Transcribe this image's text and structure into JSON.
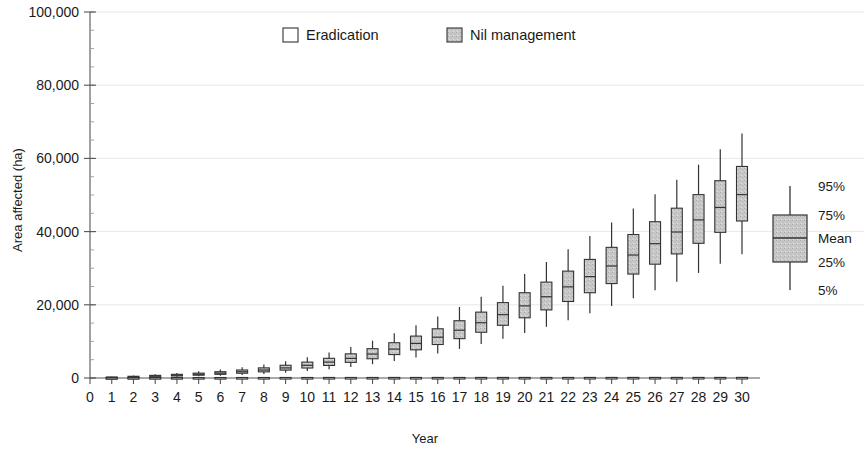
{
  "chart_data": {
    "type": "box",
    "title": "",
    "xlabel": "Year",
    "ylabel": "Area affected (ha)",
    "xlim": [
      0,
      30
    ],
    "ylim": [
      0,
      100000
    ],
    "ytick_labels": [
      "0",
      "20,000",
      "40,000",
      "60,000",
      "80,000",
      "100,000"
    ],
    "ytick_values": [
      0,
      20000,
      40000,
      60000,
      80000,
      100000
    ],
    "y_minor_step": 5000,
    "xtick_labels": [
      "0",
      "1",
      "2",
      "3",
      "4",
      "5",
      "6",
      "7",
      "8",
      "9",
      "10",
      "11",
      "12",
      "13",
      "14",
      "15",
      "16",
      "17",
      "18",
      "19",
      "20",
      "21",
      "22",
      "23",
      "24",
      "25",
      "26",
      "27",
      "28",
      "29",
      "30"
    ],
    "grid": "horizontal-major-faint",
    "legend_position": "top-center",
    "legend": [
      {
        "label": "Eradication",
        "fill": "#ffffff",
        "stroke": "#333333"
      },
      {
        "label": "Nil management",
        "fill": "#b9b9b9",
        "stroke": "#333333"
      }
    ],
    "key": {
      "labels": [
        "95%",
        "75%",
        "Mean",
        "25%",
        "5%"
      ],
      "box_fill": "#c6c6c6",
      "box_stroke": "#333333"
    },
    "series": [
      {
        "name": "Nil management",
        "fill": "#c6c6c6",
        "stroke": "#333333",
        "boxes": [
          {
            "year": 1,
            "p5": 60,
            "p25": 120,
            "mean": 180,
            "p75": 250,
            "p95": 360
          },
          {
            "year": 2,
            "p5": 130,
            "p25": 250,
            "mean": 350,
            "p75": 470,
            "p95": 680
          },
          {
            "year": 3,
            "p5": 220,
            "p25": 390,
            "mean": 540,
            "p75": 720,
            "p95": 1020
          },
          {
            "year": 4,
            "p5": 330,
            "p25": 560,
            "mean": 760,
            "p75": 1000,
            "p95": 1400
          },
          {
            "year": 5,
            "p5": 470,
            "p25": 760,
            "mean": 1020,
            "p75": 1330,
            "p95": 1840
          },
          {
            "year": 6,
            "p5": 640,
            "p25": 1000,
            "mean": 1330,
            "p75": 1720,
            "p95": 2350
          },
          {
            "year": 7,
            "p5": 850,
            "p25": 1300,
            "mean": 1710,
            "p75": 2190,
            "p95": 2960
          },
          {
            "year": 8,
            "p5": 1120,
            "p25": 1680,
            "mean": 2180,
            "p75": 2770,
            "p95": 3700
          },
          {
            "year": 9,
            "p5": 1460,
            "p25": 2150,
            "mean": 2760,
            "p75": 3480,
            "p95": 4610
          },
          {
            "year": 10,
            "p5": 1880,
            "p25": 2730,
            "mean": 3470,
            "p75": 4340,
            "p95": 5700
          },
          {
            "year": 11,
            "p5": 2400,
            "p25": 3430,
            "mean": 4330,
            "p75": 5380,
            "p95": 7000
          },
          {
            "year": 12,
            "p5": 3020,
            "p25": 4270,
            "mean": 5350,
            "p75": 6600,
            "p95": 8500
          },
          {
            "year": 13,
            "p5": 3760,
            "p25": 5260,
            "mean": 6540,
            "p75": 8020,
            "p95": 10200
          },
          {
            "year": 14,
            "p5": 4620,
            "p25": 6400,
            "mean": 7900,
            "p75": 9640,
            "p95": 12200
          },
          {
            "year": 15,
            "p5": 5600,
            "p25": 7700,
            "mean": 9450,
            "p75": 11450,
            "p95": 14400
          },
          {
            "year": 16,
            "p5": 6700,
            "p25": 9150,
            "mean": 11150,
            "p75": 13450,
            "p95": 16800
          },
          {
            "year": 17,
            "p5": 7950,
            "p25": 10750,
            "mean": 13050,
            "p75": 15650,
            "p95": 19400
          },
          {
            "year": 18,
            "p5": 9300,
            "p25": 12500,
            "mean": 15100,
            "p75": 18000,
            "p95": 22200
          },
          {
            "year": 19,
            "p5": 10750,
            "p25": 14400,
            "mean": 17300,
            "p75": 20600,
            "p95": 25200
          },
          {
            "year": 20,
            "p5": 12300,
            "p25": 16450,
            "mean": 19700,
            "p75": 23300,
            "p95": 28400
          },
          {
            "year": 21,
            "p5": 14000,
            "p25": 18600,
            "mean": 22200,
            "p75": 26200,
            "p95": 31700
          },
          {
            "year": 22,
            "p5": 15800,
            "p25": 20900,
            "mean": 24900,
            "p75": 29200,
            "p95": 35200
          },
          {
            "year": 23,
            "p5": 17700,
            "p25": 23300,
            "mean": 27700,
            "p75": 32400,
            "p95": 38800
          },
          {
            "year": 24,
            "p5": 19700,
            "p25": 25800,
            "mean": 30600,
            "p75": 35700,
            "p95": 42500
          },
          {
            "year": 25,
            "p5": 21800,
            "p25": 28400,
            "mean": 33600,
            "p75": 39200,
            "p95": 46300
          },
          {
            "year": 26,
            "p5": 24000,
            "p25": 31100,
            "mean": 36700,
            "p75": 42700,
            "p95": 50200
          },
          {
            "year": 27,
            "p5": 26300,
            "p25": 33900,
            "mean": 39900,
            "p75": 46400,
            "p95": 54200
          },
          {
            "year": 28,
            "p5": 28700,
            "p25": 36800,
            "mean": 43200,
            "p75": 50100,
            "p95": 58300
          },
          {
            "year": 29,
            "p5": 31200,
            "p25": 39800,
            "mean": 46600,
            "p75": 53900,
            "p95": 62500
          },
          {
            "year": 30,
            "p5": 33800,
            "p25": 42900,
            "mean": 50100,
            "p75": 57800,
            "p95": 66800
          }
        ]
      },
      {
        "name": "Eradication",
        "fill": "#ffffff",
        "stroke": "#333333",
        "boxes": [
          {
            "year": 1,
            "p5": 0,
            "p25": 30,
            "mean": 60,
            "p75": 95,
            "p95": 170
          },
          {
            "year": 2,
            "p5": 0,
            "p25": 35,
            "mean": 70,
            "p75": 110,
            "p95": 200
          },
          {
            "year": 3,
            "p5": 0,
            "p25": 40,
            "mean": 75,
            "p75": 120,
            "p95": 215
          },
          {
            "year": 4,
            "p5": 0,
            "p25": 40,
            "mean": 80,
            "p75": 125,
            "p95": 225
          },
          {
            "year": 5,
            "p5": 0,
            "p25": 45,
            "mean": 85,
            "p75": 130,
            "p95": 235
          },
          {
            "year": 6,
            "p5": 0,
            "p25": 45,
            "mean": 85,
            "p75": 135,
            "p95": 240
          },
          {
            "year": 7,
            "p5": 0,
            "p25": 50,
            "mean": 90,
            "p75": 140,
            "p95": 245
          },
          {
            "year": 8,
            "p5": 0,
            "p25": 50,
            "mean": 90,
            "p75": 140,
            "p95": 250
          },
          {
            "year": 9,
            "p5": 0,
            "p25": 50,
            "mean": 95,
            "p75": 145,
            "p95": 255
          },
          {
            "year": 10,
            "p5": 0,
            "p25": 55,
            "mean": 95,
            "p75": 145,
            "p95": 255
          },
          {
            "year": 11,
            "p5": 0,
            "p25": 55,
            "mean": 95,
            "p75": 150,
            "p95": 260
          },
          {
            "year": 12,
            "p5": 0,
            "p25": 55,
            "mean": 100,
            "p75": 150,
            "p95": 260
          },
          {
            "year": 13,
            "p5": 0,
            "p25": 55,
            "mean": 100,
            "p75": 150,
            "p95": 265
          },
          {
            "year": 14,
            "p5": 0,
            "p25": 55,
            "mean": 100,
            "p75": 155,
            "p95": 265
          },
          {
            "year": 15,
            "p5": 0,
            "p25": 60,
            "mean": 100,
            "p75": 155,
            "p95": 265
          },
          {
            "year": 16,
            "p5": 0,
            "p25": 60,
            "mean": 100,
            "p75": 155,
            "p95": 270
          },
          {
            "year": 17,
            "p5": 0,
            "p25": 60,
            "mean": 105,
            "p75": 155,
            "p95": 270
          },
          {
            "year": 18,
            "p5": 0,
            "p25": 60,
            "mean": 105,
            "p75": 160,
            "p95": 270
          },
          {
            "year": 19,
            "p5": 0,
            "p25": 60,
            "mean": 105,
            "p75": 160,
            "p95": 270
          },
          {
            "year": 20,
            "p5": 0,
            "p25": 60,
            "mean": 105,
            "p75": 160,
            "p95": 275
          },
          {
            "year": 21,
            "p5": 0,
            "p25": 60,
            "mean": 105,
            "p75": 160,
            "p95": 275
          },
          {
            "year": 22,
            "p5": 0,
            "p25": 60,
            "mean": 105,
            "p75": 160,
            "p95": 275
          },
          {
            "year": 23,
            "p5": 0,
            "p25": 60,
            "mean": 105,
            "p75": 160,
            "p95": 275
          },
          {
            "year": 24,
            "p5": 0,
            "p25": 60,
            "mean": 105,
            "p75": 160,
            "p95": 275
          },
          {
            "year": 25,
            "p5": 0,
            "p25": 60,
            "mean": 110,
            "p75": 165,
            "p95": 275
          },
          {
            "year": 26,
            "p5": 0,
            "p25": 60,
            "mean": 110,
            "p75": 165,
            "p95": 280
          },
          {
            "year": 27,
            "p5": 0,
            "p25": 60,
            "mean": 110,
            "p75": 165,
            "p95": 280
          },
          {
            "year": 28,
            "p5": 0,
            "p25": 60,
            "mean": 110,
            "p75": 165,
            "p95": 280
          },
          {
            "year": 29,
            "p5": 0,
            "p25": 60,
            "mean": 110,
            "p75": 165,
            "p95": 280
          },
          {
            "year": 30,
            "p5": 0,
            "p25": 60,
            "mean": 110,
            "p75": 165,
            "p95": 280
          }
        ]
      }
    ]
  }
}
